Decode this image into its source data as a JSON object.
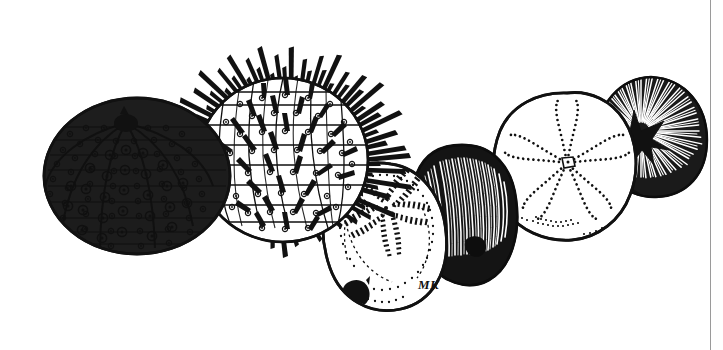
{
  "plate": {
    "title": "Echinoidea line-art plate",
    "caption": "",
    "background_color": "#ffffff",
    "ink_color": "#111111",
    "width": 723,
    "height": 350,
    "signature": "MK"
  },
  "border": {
    "right_rule_color": "#9a9a9a",
    "right_rule_x": 710
  },
  "specimens": [
    {
      "id": "urchin-test",
      "label": "Sea urchin test",
      "order": 1,
      "center": [
        137,
        176
      ],
      "radius": [
        93,
        78
      ],
      "features": "denuded test with tubercles, ambulacral and interambulacral plate columns, dark apical system",
      "apical_opening": [
        126,
        123
      ]
    },
    {
      "id": "spiny-urchin",
      "label": "Spiny sea urchin",
      "order": 2,
      "center": [
        283,
        160
      ],
      "radius": [
        85,
        82
      ],
      "features": "living urchin with long radiating spines over a tuberculate test",
      "spine_count": 96
    },
    {
      "id": "sea-biscuit-test",
      "label": "Sea biscuit test",
      "order": 3,
      "center": [
        385,
        235
      ],
      "radius": [
        62,
        72
      ],
      "features": "flattened test with five dashed petaloids and dark periproct",
      "periproct": [
        352,
        290
      ]
    },
    {
      "id": "sea-biscuit-live",
      "label": "Living sea biscuit",
      "order": 4,
      "center": [
        465,
        213
      ],
      "radius": [
        52,
        68
      ],
      "features": "dense short spine coat, dark velvety texture"
    },
    {
      "id": "sand-dollar-test",
      "label": "Sand dollar test",
      "order": 5,
      "center": [
        567,
        165
      ],
      "radius": [
        68,
        72
      ],
      "features": "five dotted petaloids radiating from central madreporite",
      "madreporite": [
        567,
        163
      ]
    },
    {
      "id": "sand-dollar-live",
      "label": "Living sand dollar",
      "order": 6,
      "center": [
        650,
        135
      ],
      "radius": [
        55,
        60
      ],
      "features": "dense radiating short-spine coat"
    }
  ]
}
